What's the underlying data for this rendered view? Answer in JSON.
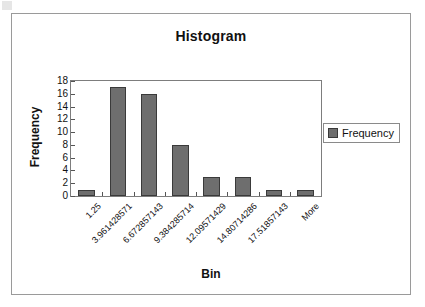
{
  "chart_data": {
    "type": "bar",
    "title": "Histogram",
    "xlabel": "Bin",
    "ylabel": "Frequency",
    "categories": [
      "1.25",
      "3.961428571",
      "6.672857143",
      "9.384285714",
      "12.09571429",
      "14.80714286",
      "17.51857143",
      "More"
    ],
    "values": [
      1,
      17,
      16,
      8,
      3,
      3,
      1,
      1
    ],
    "series": [
      {
        "name": "Frequency",
        "values": [
          1,
          17,
          16,
          8,
          3,
          3,
          1,
          1
        ]
      }
    ],
    "ylim": [
      0,
      18
    ],
    "yticks": [
      18,
      16,
      14,
      12,
      10,
      8,
      6,
      4,
      2,
      0
    ],
    "ytick_step": 2,
    "grid": false,
    "legend_position": "right",
    "legend_entries": [
      "Frequency"
    ],
    "bar_color": "#6e6e6e",
    "bar_border_color": "#3a3a3a",
    "axis_color": "#7d7d7d",
    "frame_color": "#9a9a9a",
    "text_color": "#111111",
    "background": "#ffffff"
  },
  "legend": {
    "swatch_name": "frequency-color-swatch",
    "label": "Frequency"
  }
}
